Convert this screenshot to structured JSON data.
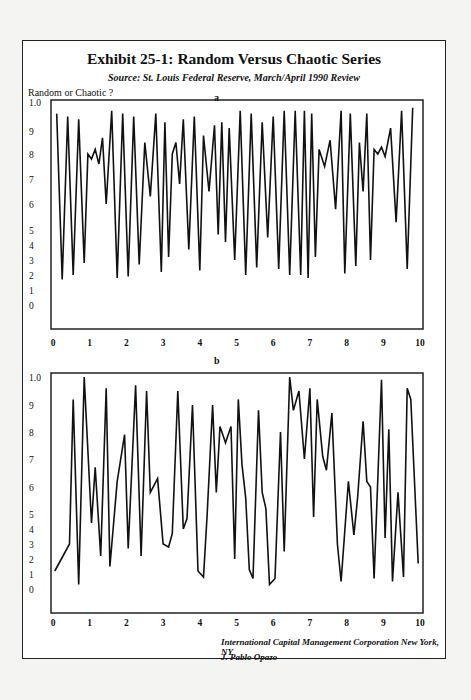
{
  "title": "Exhibit 25-1: Random Versus Chaotic Series",
  "subtitle": "Source: St. Louis Federal Reserve, March/April 1990 Review",
  "y_axis_label": "Random or Chaotic ?",
  "footer": {
    "line1": "International Capital Management Corporation New York, NY",
    "line2": "J. Pablo Opazo"
  },
  "colors": {
    "line": "#111111",
    "frame": "#222222",
    "background": "#ffffff"
  },
  "chart_data": [
    {
      "type": "line",
      "panel_label": "a",
      "title": "",
      "xlabel": "",
      "ylabel": "Random or Chaotic ?",
      "xlim": [
        0,
        10
      ],
      "ylim": [
        0,
        1.0
      ],
      "grid": false,
      "x_ticks": [
        "0",
        "1",
        "2",
        "3",
        "4",
        "5",
        "6",
        "7",
        "8",
        "9",
        "10"
      ],
      "y_ticks": [
        "1.0",
        "9",
        "8",
        "7",
        "6",
        "5",
        "4",
        "3",
        "2",
        "1",
        "0"
      ],
      "x": [
        0.1,
        0.25,
        0.4,
        0.55,
        0.7,
        0.85,
        0.95,
        1.05,
        1.15,
        1.25,
        1.35,
        1.45,
        1.6,
        1.75,
        1.9,
        2.05,
        2.2,
        2.35,
        2.5,
        2.65,
        2.8,
        2.95,
        3.05,
        3.15,
        3.25,
        3.35,
        3.45,
        3.55,
        3.7,
        3.85,
        4.0,
        4.1,
        4.25,
        4.4,
        4.5,
        4.6,
        4.7,
        4.8,
        4.95,
        5.1,
        5.25,
        5.4,
        5.55,
        5.7,
        5.85,
        6.0,
        6.15,
        6.3,
        6.45,
        6.6,
        6.75,
        6.85,
        6.95,
        7.05,
        7.15,
        7.25,
        7.4,
        7.55,
        7.7,
        7.85,
        7.95,
        8.1,
        8.25,
        8.35,
        8.45,
        8.55,
        8.65,
        8.75,
        8.85,
        8.95,
        9.05,
        9.2,
        9.35,
        9.5,
        9.65,
        9.8
      ],
      "values": [
        0.96,
        0.17,
        0.95,
        0.2,
        0.94,
        0.28,
        0.8,
        0.78,
        0.82,
        0.76,
        0.87,
        0.6,
        0.97,
        0.18,
        0.96,
        0.19,
        0.95,
        0.27,
        0.85,
        0.63,
        0.96,
        0.22,
        0.93,
        0.32,
        0.8,
        0.85,
        0.68,
        0.94,
        0.37,
        0.95,
        0.23,
        0.88,
        0.65,
        0.92,
        0.47,
        0.93,
        0.42,
        0.91,
        0.3,
        0.97,
        0.2,
        0.96,
        0.25,
        0.93,
        0.45,
        0.95,
        0.24,
        0.97,
        0.2,
        0.97,
        0.2,
        0.97,
        0.18,
        0.96,
        0.32,
        0.82,
        0.75,
        0.86,
        0.58,
        0.97,
        0.21,
        0.96,
        0.26,
        0.85,
        0.65,
        0.96,
        0.3,
        0.82,
        0.8,
        0.83,
        0.79,
        0.91,
        0.53,
        0.97,
        0.24,
        0.98
      ]
    },
    {
      "type": "line",
      "panel_label": "b",
      "title": "",
      "xlabel": "",
      "ylabel": "",
      "xlim": [
        0,
        10
      ],
      "ylim": [
        0,
        1.0
      ],
      "grid": false,
      "x_ticks": [
        "0",
        "1",
        "2",
        "3",
        "4",
        "5",
        "6",
        "7",
        "8",
        "9",
        "10"
      ],
      "y_ticks": [
        "1.0",
        "9",
        "8",
        "7",
        "6",
        "5",
        "4",
        "3",
        "2",
        "1",
        "0"
      ],
      "x": [
        0.05,
        0.45,
        0.55,
        0.7,
        0.85,
        1.05,
        1.15,
        1.3,
        1.45,
        1.55,
        1.75,
        1.95,
        2.05,
        2.25,
        2.4,
        2.55,
        2.65,
        2.85,
        3.0,
        3.15,
        3.25,
        3.4,
        3.55,
        3.65,
        3.8,
        3.95,
        4.1,
        4.2,
        4.35,
        4.45,
        4.55,
        4.7,
        4.85,
        4.95,
        5.05,
        5.15,
        5.25,
        5.35,
        5.45,
        5.6,
        5.7,
        5.8,
        5.9,
        6.05,
        6.2,
        6.3,
        6.45,
        6.55,
        6.7,
        6.85,
        7.0,
        7.1,
        7.2,
        7.35,
        7.45,
        7.6,
        7.75,
        7.85,
        8.05,
        8.2,
        8.3,
        8.45,
        8.55,
        8.65,
        8.75,
        8.95,
        9.05,
        9.15,
        9.25,
        9.4,
        9.55,
        9.65,
        9.75,
        9.95
      ],
      "values": [
        0.12,
        0.3,
        0.92,
        0.03,
        1.0,
        0.44,
        0.67,
        0.22,
        0.96,
        0.15,
        0.62,
        0.79,
        0.27,
        0.97,
        0.22,
        0.95,
        0.58,
        0.63,
        0.3,
        0.28,
        0.37,
        0.95,
        0.4,
        0.47,
        0.9,
        0.12,
        0.08,
        0.49,
        0.9,
        0.58,
        0.82,
        0.76,
        0.82,
        0.2,
        0.92,
        0.68,
        0.56,
        0.13,
        0.07,
        0.88,
        0.58,
        0.52,
        0.03,
        0.07,
        0.8,
        0.25,
        1.0,
        0.88,
        0.95,
        0.7,
        0.96,
        0.48,
        0.92,
        0.71,
        0.66,
        0.87,
        0.3,
        0.05,
        0.62,
        0.36,
        0.56,
        0.84,
        0.62,
        0.6,
        0.07,
        0.99,
        0.34,
        0.81,
        0.05,
        0.58,
        0.08,
        0.96,
        0.92,
        0.17
      ]
    }
  ]
}
